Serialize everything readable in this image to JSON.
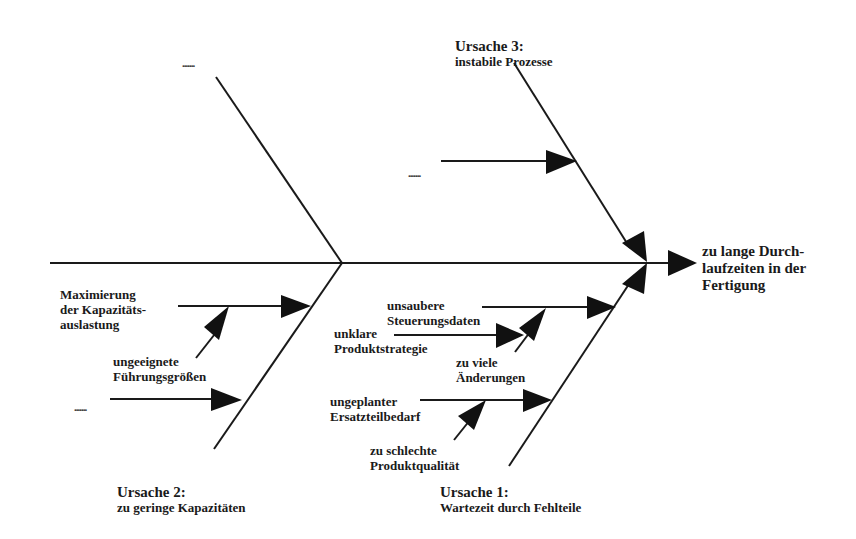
{
  "effect": {
    "line1": "zu lange Durch-",
    "line2": "laufzeiten in der",
    "line3": "Fertigung"
  },
  "cause3": {
    "title": "Ursache 3:",
    "subtitle": "instabile Prozesse",
    "sub_cause": "......."
  },
  "top_left": {
    "placeholder": "......."
  },
  "cause2": {
    "title": "Ursache 2:",
    "subtitle": "zu geringe Kapazitäten",
    "sub_causes": [
      {
        "line1": "Maximierung",
        "line2": "der Kapazitäts-",
        "line3": "auslastung"
      },
      {
        "line1": "ungeeignete",
        "line2": "Führungsgrößen"
      },
      {
        "line1": "......."
      }
    ]
  },
  "cause1": {
    "title": "Ursache 1:",
    "subtitle": "Wartezeit durch Fehlteile",
    "sub_causes": [
      {
        "line1": "unsaubere",
        "line2": "Steuerungsdaten"
      },
      {
        "line1": "unklare",
        "line2": "Produktstrategie"
      },
      {
        "line1": "zu viele",
        "line2": "Änderungen"
      },
      {
        "line1": "ungeplanter",
        "line2": "Ersatzteilbedarf"
      },
      {
        "line1": "zu schlechte",
        "line2": "Produktqualität"
      }
    ]
  },
  "colors": {
    "line": "#1a1a1a",
    "arrow": "#111111",
    "text": "#1a1a1a",
    "background": "#ffffff"
  }
}
